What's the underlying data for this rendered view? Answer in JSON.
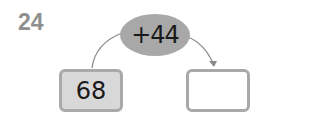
{
  "problem": {
    "number": "24",
    "operation": "+44",
    "start_value": "68",
    "answer_value": ""
  },
  "colors": {
    "number": "#8f8f8f",
    "oval": "#a8a8a8",
    "box_border": "#a9a9a9",
    "start_fill": "#d8d8d8",
    "answer_fill": "#ffffff"
  }
}
